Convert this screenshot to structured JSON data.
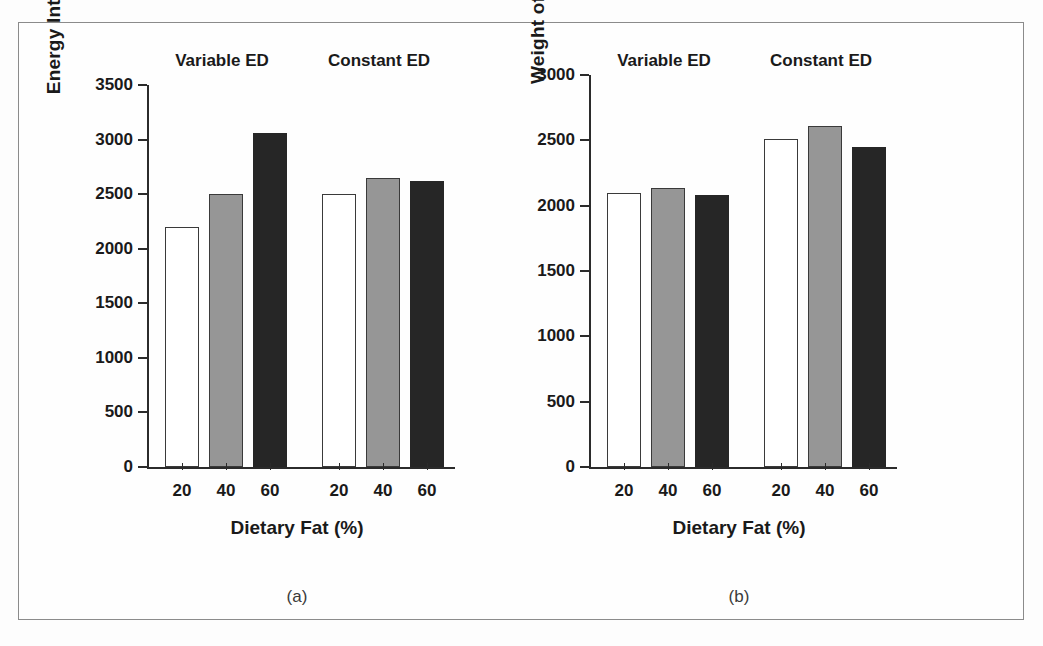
{
  "chart_data": [
    {
      "type": "bar",
      "panel": "(a)",
      "title": "",
      "xlabel": "Dietary Fat (%)",
      "ylabel": "Energy Intake (kcal/day)",
      "ylim": [
        0,
        3500
      ],
      "yticks": [
        0,
        500,
        1000,
        1500,
        2000,
        2500,
        3000,
        3500
      ],
      "ytick_labels": [
        "0",
        "500",
        "1000",
        "1500",
        "2000",
        "2500",
        "3000",
        "3500"
      ],
      "grid": false,
      "legend": "none",
      "groups": [
        "Variable ED",
        "Constant ED"
      ],
      "categories": [
        "20",
        "40",
        "60"
      ],
      "series": [
        {
          "name": "Variable ED",
          "values": [
            2200,
            2500,
            3060
          ]
        },
        {
          "name": "Constant ED",
          "values": [
            2500,
            2650,
            2620
          ]
        }
      ],
      "bar_colors": [
        "#ffffff",
        "#969696",
        "#262626"
      ]
    },
    {
      "type": "bar",
      "panel": "(b)",
      "title": "",
      "xlabel": "Dietary Fat (%)",
      "ylabel": "Weight of Food (g/day)",
      "ylim": [
        0,
        3000
      ],
      "yticks": [
        0,
        500,
        1000,
        1500,
        2000,
        2500,
        3000
      ],
      "ytick_labels": [
        "0",
        "500",
        "1000",
        "1500",
        "2000",
        "2500",
        "3000"
      ],
      "grid": false,
      "legend": "none",
      "groups": [
        "Variable ED",
        "Constant ED"
      ],
      "categories": [
        "20",
        "40",
        "60"
      ],
      "series": [
        {
          "name": "Variable ED",
          "values": [
            2100,
            2135,
            2080
          ]
        },
        {
          "name": "Constant ED",
          "values": [
            2510,
            2610,
            2450
          ]
        }
      ],
      "bar_colors": [
        "#ffffff",
        "#969696",
        "#262626"
      ]
    }
  ],
  "panel_a": {
    "ylabel": "Energy Intake (kcal/day)",
    "xlabel": "Dietary Fat (%)",
    "tag": "(a)",
    "group1": "Variable ED",
    "group2": "Constant ED",
    "yt": [
      "3500",
      "3000",
      "2500",
      "2000",
      "1500",
      "1000",
      "500",
      "0"
    ],
    "xt": [
      "20",
      "40",
      "60",
      "20",
      "40",
      "60"
    ]
  },
  "panel_b": {
    "ylabel": "Weight of Food (g/day)",
    "xlabel": "Dietary Fat (%)",
    "tag": "(b)",
    "group1": "Variable ED",
    "group2": "Constant ED",
    "yt": [
      "3000",
      "2500",
      "2000",
      "1500",
      "1000",
      "500",
      "0"
    ],
    "xt": [
      "20",
      "40",
      "60",
      "20",
      "40",
      "60"
    ]
  }
}
